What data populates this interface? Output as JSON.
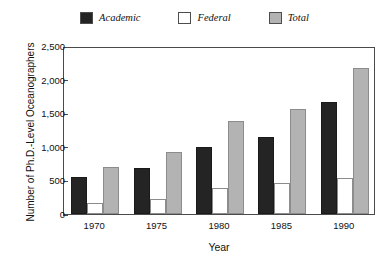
{
  "chart_data": {
    "type": "bar",
    "title": "",
    "subtitle": "",
    "xlabel": "Year",
    "ylabel": "Number of Ph.D.-Level Oceanographers",
    "categories": [
      "1970",
      "1975",
      "1980",
      "1985",
      "1990"
    ],
    "series": [
      {
        "name": "Academic",
        "color": "#242424",
        "values": [
          550,
          680,
          1000,
          1140,
          1670
        ]
      },
      {
        "name": "Federal",
        "color": "#ffffff",
        "values": [
          160,
          230,
          390,
          455,
          530
        ]
      },
      {
        "name": "Total",
        "color": "#b3b3b3",
        "values": [
          700,
          930,
          1380,
          1560,
          2180
        ]
      }
    ],
    "ylim": [
      0,
      2500
    ],
    "ytick_values": [
      0,
      500,
      1000,
      1500,
      2000,
      2500
    ],
    "ytick_labels": [
      "0",
      "500",
      "1,000",
      "1,500",
      "2,000",
      "2,500"
    ],
    "grid": false,
    "legend_position": "top-center",
    "frame": "box"
  },
  "legend": {
    "items": [
      {
        "label": "Academic",
        "swatch_color": "#242424"
      },
      {
        "label": "Federal",
        "swatch_color": "#ffffff"
      },
      {
        "label": "Total",
        "swatch_color": "#b3b3b3"
      }
    ]
  },
  "axes": {
    "y_title": "Number of Ph.D.-Level Oceanographers",
    "x_title": "Year"
  }
}
